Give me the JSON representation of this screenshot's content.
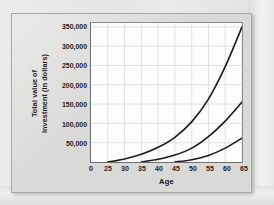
{
  "figure": {
    "y_axis_title_line1": "Total value of",
    "y_axis_title_line2": "investment (in dollars)",
    "x_axis_title": "Age"
  },
  "colors": {
    "page_background": "#e9e9e7",
    "panel_background": "#d9d9d7",
    "panel_border": "#a9a9a7",
    "plot_background": "#fdfdfd",
    "axis_line": "#6f6f6f",
    "gridline": "#e0e0e0",
    "curve": "#1a1a1a",
    "tick_label": "#1d1d1d"
  },
  "chart_data": {
    "type": "line",
    "title": "",
    "subtitle": "",
    "xlabel": "Age",
    "ylabel": "Total value of investment (in dollars)",
    "xlim": [
      20,
      65
    ],
    "ylim": [
      0,
      360000
    ],
    "grid": true,
    "legend_position": "none",
    "x_ticks": [
      {
        "value": 20,
        "label": "0"
      },
      {
        "value": 25,
        "label": "25"
      },
      {
        "value": 30,
        "label": "30"
      },
      {
        "value": 35,
        "label": "35"
      },
      {
        "value": 40,
        "label": "40"
      },
      {
        "value": 45,
        "label": "45"
      },
      {
        "value": 50,
        "label": "50"
      },
      {
        "value": 55,
        "label": "55"
      },
      {
        "value": 60,
        "label": "60"
      },
      {
        "value": 65,
        "label": "65"
      }
    ],
    "y_ticks": [
      {
        "value": 350000,
        "label": "350,000"
      },
      {
        "value": 300000,
        "label": "300,000"
      },
      {
        "value": 250000,
        "label": "250,000"
      },
      {
        "value": 200000,
        "label": "200,000"
      },
      {
        "value": 150000,
        "label": "150,000"
      },
      {
        "value": 100000,
        "label": "100,000"
      },
      {
        "value": 50000,
        "label": "50,000"
      }
    ],
    "series": [
      {
        "name": "start-age-25",
        "start_age": 25,
        "end_age": 65,
        "end_value": 350000,
        "x": [
          25,
          30,
          35,
          40,
          45,
          50,
          55,
          60,
          65
        ],
        "y": [
          0,
          8000,
          20000,
          38000,
          64000,
          104000,
          163000,
          247000,
          350000
        ]
      },
      {
        "name": "start-age-35",
        "start_age": 35,
        "end_age": 65,
        "end_value": 155000,
        "x": [
          35,
          40,
          45,
          50,
          55,
          60,
          65
        ],
        "y": [
          0,
          7000,
          18000,
          36000,
          66000,
          106000,
          155000
        ]
      },
      {
        "name": "start-age-45",
        "start_age": 45,
        "end_age": 65,
        "end_value": 62000,
        "x": [
          45,
          50,
          55,
          60,
          65
        ],
        "y": [
          0,
          6000,
          17000,
          36000,
          62000
        ]
      }
    ]
  }
}
